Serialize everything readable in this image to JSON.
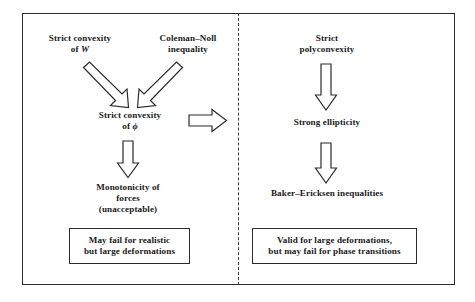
{
  "diagram": {
    "colors": {
      "ink": "#1a1a1a",
      "line": "#2b2b2b",
      "background": "#ffffff",
      "divider": "#3a3a3a"
    },
    "left_column": {
      "nodes": [
        {
          "id": "strict-convexity-w",
          "text": "Strict convexity\nof W",
          "symbol": "W"
        },
        {
          "id": "coleman-noll",
          "text": "Coleman–Noll\ninequality"
        },
        {
          "id": "strict-convexity-phi",
          "text": "Strict convexity\nof ϕ",
          "symbol": "ϕ"
        },
        {
          "id": "monotonicity",
          "text": "Monotonicity of\nforces\n(unacceptable)"
        }
      ],
      "conclusion": "May fail for realistic\nbut large deformations"
    },
    "right_column": {
      "nodes": [
        {
          "id": "strict-polyconvexity",
          "text": "Strict\npolyconvexity"
        },
        {
          "id": "strong-ellipticity",
          "text": "Strong ellipticity"
        },
        {
          "id": "baker-ericksen",
          "text": "Baker–Ericksen inequalities"
        }
      ],
      "conclusion": "Valid for large deformations,\nbut may fail for phase transitions"
    },
    "arrows": [
      {
        "id": "arrow-w-to-phi",
        "direction": "down-right",
        "from": "strict-convexity-w",
        "to": "strict-convexity-phi"
      },
      {
        "id": "arrow-coleman-to-phi",
        "direction": "down-left",
        "from": "coleman-noll",
        "to": "strict-convexity-phi"
      },
      {
        "id": "arrow-phi-to-ellipticity",
        "direction": "right",
        "from": "strict-convexity-phi",
        "to": "strong-ellipticity"
      },
      {
        "id": "arrow-phi-to-monotonicity",
        "direction": "down",
        "from": "strict-convexity-phi",
        "to": "monotonicity"
      },
      {
        "id": "arrow-polyconvexity-to-ellipticity",
        "direction": "down",
        "from": "strict-polyconvexity",
        "to": "strong-ellipticity"
      },
      {
        "id": "arrow-ellipticity-to-baker",
        "direction": "down",
        "from": "strong-ellipticity",
        "to": "baker-ericksen"
      }
    ]
  }
}
